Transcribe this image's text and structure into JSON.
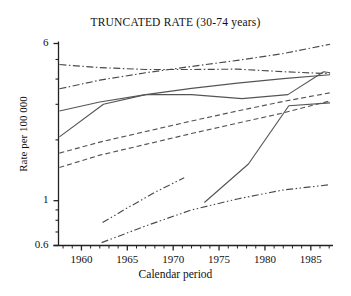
{
  "chart_data": {
    "type": "line",
    "title": "TRUNCATED RATE (30-74 years)",
    "xlabel": "Calendar period",
    "ylabel": "Rate per 100 000",
    "yscale": "log",
    "ylim": [
      0.6,
      6
    ],
    "xlim": [
      1957.5,
      1987.2
    ],
    "grid": false,
    "legend": "none",
    "yticks": [
      {
        "value": 6,
        "label": "6"
      },
      {
        "value": 1,
        "label": "1"
      },
      {
        "value": 0.6,
        "label": "0.6"
      }
    ],
    "xticks": [
      {
        "value": 1960,
        "label": "1960"
      },
      {
        "value": 1965,
        "label": "1965"
      },
      {
        "value": 1970,
        "label": "1970"
      },
      {
        "value": 1975,
        "label": "1975"
      },
      {
        "value": 1980,
        "label": "1980"
      },
      {
        "value": 1985,
        "label": "1985"
      }
    ],
    "xminor_step": 1,
    "series": [
      {
        "name": "series-1-dashdot-declining",
        "style": "dashdot",
        "color": "#4a4a4a",
        "x": [
          1957.6,
          1962,
          1967,
          1972,
          1977,
          1982,
          1987.1
        ],
        "y": [
          4.72,
          4.56,
          4.46,
          4.46,
          4.48,
          4.35,
          4.25
        ]
      },
      {
        "name": "series-2-dashdot-rising",
        "style": "dashdot",
        "color": "#4a4a4a",
        "x": [
          1957.6,
          1962,
          1967,
          1972,
          1977,
          1982,
          1987.1
        ],
        "y": [
          3.58,
          3.95,
          4.3,
          4.62,
          4.95,
          5.35,
          5.95
        ]
      },
      {
        "name": "series-3-solid-upper",
        "style": "solid",
        "color": "#555555",
        "x": [
          1957.6,
          1962,
          1967,
          1972,
          1977,
          1982,
          1987.1
        ],
        "y": [
          2.78,
          3.08,
          3.35,
          3.6,
          3.82,
          4.02,
          4.2
        ]
      },
      {
        "name": "series-4-solid-plateau",
        "style": "solid",
        "color": "#555555",
        "x": [
          1957.6,
          1962.4,
          1967,
          1972,
          1977.5,
          1982.5,
          1986.4,
          1987.1
        ],
        "y": [
          2.07,
          3.0,
          3.35,
          3.35,
          3.2,
          3.35,
          4.35,
          4.3
        ]
      },
      {
        "name": "series-5-dashed-upper",
        "style": "dashed",
        "color": "#555555",
        "x": [
          1957.6,
          1962,
          1967,
          1972,
          1977,
          1982,
          1987.1
        ],
        "y": [
          1.72,
          1.95,
          2.2,
          2.48,
          2.78,
          3.1,
          3.42
        ]
      },
      {
        "name": "series-6-dashed-lower",
        "style": "dashed",
        "color": "#555555",
        "x": [
          1957.6,
          1962,
          1967,
          1972,
          1977,
          1982,
          1987.1
        ],
        "y": [
          1.46,
          1.68,
          1.9,
          2.15,
          2.42,
          2.72,
          3.12
        ]
      },
      {
        "name": "series-7-dashdotdot-short",
        "style": "dashdotdot",
        "color": "#4a4a4a",
        "x": [
          1962.3,
          1965,
          1968,
          1971.2
        ],
        "y": [
          0.78,
          0.92,
          1.1,
          1.3
        ]
      },
      {
        "name": "series-8-dashdotdot-long",
        "style": "dashdotdot",
        "color": "#4a4a4a",
        "x": [
          1962.2,
          1967,
          1972,
          1977,
          1982,
          1987.1
        ],
        "y": [
          0.62,
          0.75,
          0.9,
          1.02,
          1.13,
          1.2
        ]
      },
      {
        "name": "series-9-solid-steep",
        "style": "solid",
        "color": "#555555",
        "x": [
          1973.4,
          1978.2,
          1982.6,
          1987.1
        ],
        "y": [
          0.98,
          1.52,
          2.95,
          3.05
        ]
      }
    ]
  },
  "axis": {
    "title": "TRUNCATED RATE (30-74 years)",
    "xlabel": "Calendar period",
    "ylabel": "Rate per 100 000"
  }
}
